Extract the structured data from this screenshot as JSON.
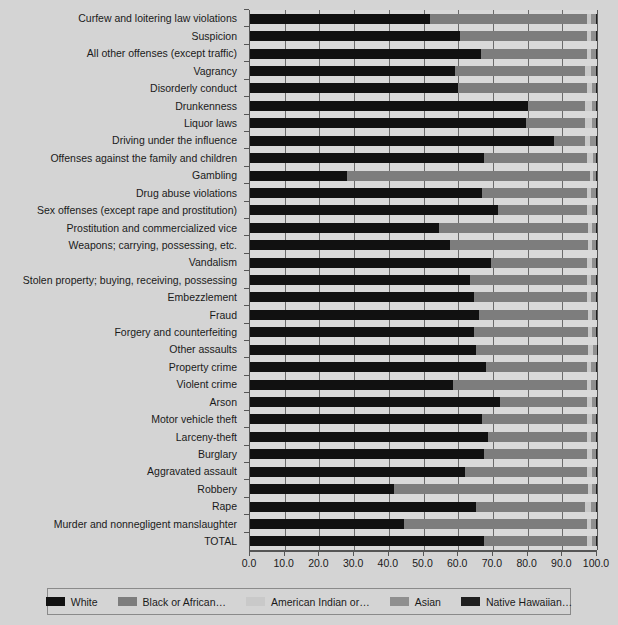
{
  "chart_data": {
    "type": "bar",
    "orientation": "horizontal",
    "stacked": true,
    "title": "",
    "xlabel": "",
    "ylabel": "",
    "xlim": [
      0,
      100
    ],
    "xticks": [
      0.0,
      10.0,
      20.0,
      30.0,
      40.0,
      50.0,
      60.0,
      70.0,
      80.0,
      90.0,
      100.0
    ],
    "xtick_labels": [
      "0.0",
      "10.0",
      "20.0",
      "30.0",
      "40.0",
      "50.0",
      "60.0",
      "70.0",
      "80.0",
      "90.0",
      "100.0"
    ],
    "grid": true,
    "legend_position": "bottom",
    "categories": [
      "Curfew and loitering law violations",
      "Suspicion",
      "All other offenses (except traffic)",
      "Vagrancy",
      "Disorderly conduct",
      "Drunkenness",
      "Liquor laws",
      "Driving under the influence",
      "Offenses against the family and children",
      "Gambling",
      "Drug abuse violations",
      "Sex offenses (except rape and prostitution)",
      "Prostitution and commercialized vice",
      "Weapons; carrying, possessing, etc.",
      "Vandalism",
      "Stolen property; buying, receiving, possessing",
      "Embezzlement",
      "Fraud",
      "Forgery and counterfeiting",
      "Other assaults",
      "Property crime",
      "Violent crime",
      "Arson",
      "Motor vehicle theft",
      "Larceny-theft",
      "Burglary",
      "Aggravated assault",
      "Robbery",
      "Rape",
      "Murder and nonnegligent manslaughter",
      "TOTAL"
    ],
    "series": [
      {
        "name": "White",
        "color": "#111111",
        "values": [
          52.0,
          60.5,
          66.5,
          59.0,
          60.0,
          80.0,
          79.5,
          87.5,
          67.5,
          28.0,
          67.0,
          71.5,
          54.5,
          57.5,
          69.5,
          63.5,
          64.5,
          66.0,
          64.5,
          65.0,
          68.0,
          58.5,
          72.0,
          67.0,
          68.5,
          67.5,
          62.0,
          41.5,
          65.0,
          44.5,
          67.5
        ]
      },
      {
        "name": "Black or African…",
        "color": "#7d7d7d",
        "values": [
          45.0,
          36.5,
          30.5,
          37.5,
          37.0,
          16.5,
          17.0,
          9.0,
          29.5,
          70.0,
          30.0,
          25.5,
          43.0,
          40.0,
          27.5,
          33.5,
          32.5,
          31.5,
          33.0,
          32.5,
          29.0,
          38.5,
          25.0,
          30.0,
          28.5,
          29.5,
          35.0,
          56.0,
          31.5,
          52.5,
          29.5
        ]
      },
      {
        "name": "American Indian or…",
        "color": "#c9c9c9",
        "values": [
          1.2,
          1.3,
          1.3,
          1.9,
          1.7,
          2.2,
          2.2,
          1.5,
          1.8,
          0.8,
          1.2,
          1.5,
          1.0,
          1.1,
          1.5,
          1.4,
          1.3,
          1.2,
          1.2,
          1.4,
          1.4,
          1.3,
          1.6,
          1.5,
          1.4,
          1.5,
          1.5,
          1.1,
          1.9,
          1.4,
          1.5
        ]
      },
      {
        "name": "Asian",
        "color": "#8f8f8f",
        "values": [
          1.4,
          1.3,
          1.3,
          1.3,
          1.0,
          1.0,
          1.0,
          1.7,
          1.0,
          1.0,
          1.5,
          1.2,
          1.3,
          1.2,
          1.3,
          1.4,
          1.4,
          1.1,
          1.1,
          1.0,
          1.4,
          1.5,
          1.2,
          1.3,
          1.4,
          1.3,
          1.3,
          1.2,
          1.4,
          1.4,
          1.3
        ]
      },
      {
        "name": "Native Hawaiian…",
        "color": "#1f1f1f",
        "values": [
          0.4,
          0.4,
          0.4,
          0.3,
          0.3,
          0.3,
          0.3,
          0.3,
          0.2,
          0.2,
          0.3,
          0.3,
          0.2,
          0.2,
          0.2,
          0.2,
          0.3,
          0.2,
          0.2,
          0.1,
          0.2,
          0.2,
          0.2,
          0.2,
          0.2,
          0.2,
          0.2,
          0.2,
          0.2,
          0.2,
          0.2
        ]
      }
    ]
  },
  "legend": {
    "items": [
      {
        "label": "White",
        "color": "#111111"
      },
      {
        "label": "Black or African…",
        "color": "#7d7d7d"
      },
      {
        "label": "American Indian or…",
        "color": "#c9c9c9"
      },
      {
        "label": "Asian",
        "color": "#8f8f8f"
      },
      {
        "label": "Native Hawaiian…",
        "color": "#1f1f1f"
      }
    ]
  },
  "colors": {
    "background": "#d4d4d4",
    "plot_background": "#d9d9d9",
    "gridline": "#6b6b6b",
    "axis": "#555555",
    "text": "#1a1a1a"
  }
}
